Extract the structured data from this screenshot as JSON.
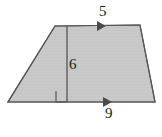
{
  "figure": {
    "name": "trapezoid-with-height",
    "shape_type": "trapezoid",
    "fill_color": "#c9c9c9",
    "stroke_color": "#4d4d4d",
    "label_color": "#1a1a1a",
    "background_color": "#ffffff",
    "vertices": {
      "top_left": [
        55,
        26
      ],
      "top_right": [
        140,
        25
      ],
      "bottom_right": [
        155,
        102
      ],
      "bottom_left": [
        8,
        102
      ]
    },
    "height_segment": {
      "name": "height-line",
      "from": [
        67,
        26
      ],
      "to": [
        67,
        102
      ]
    },
    "right_angle_marker": {
      "name": "right-angle-marker",
      "x": 57,
      "y": 91,
      "size": 11
    },
    "parallel_marks": [
      {
        "name": "top-edge-arrow",
        "x": 101,
        "y": 26,
        "direction": "right"
      },
      {
        "name": "bottom-edge-arrow",
        "x": 107,
        "y": 102,
        "direction": "right"
      }
    ]
  },
  "labels": {
    "top_side": "5",
    "height": "6",
    "base_side": "9"
  }
}
